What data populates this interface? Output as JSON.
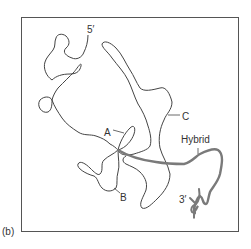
{
  "figure": {
    "panel_label": "(b)",
    "frame": {
      "stroke": "#555555"
    },
    "strands": {
      "rna": {
        "stroke": "#444444",
        "width": 1
      },
      "hybrid": {
        "stroke": "#7a7a7a",
        "width": 2.4
      }
    },
    "labels": {
      "five_prime": "5′",
      "three_prime": "3′",
      "a": "A",
      "b": "B",
      "c": "C",
      "hybrid": "Hybrid"
    }
  }
}
